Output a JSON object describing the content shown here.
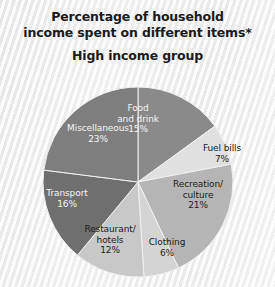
{
  "title": {
    "line1": "Percentage of household",
    "line2": "income spent on different items*",
    "subtitle": "High income group"
  },
  "chart_data": {
    "type": "pie",
    "title": "Percentage of household income spent on different items* High income group",
    "unit": "%",
    "start_angle_deg": 0,
    "direction": "clockwise",
    "total": 100,
    "legend": "none",
    "grid": false,
    "categories": [
      "Food and drink",
      "Fuel bills",
      "Recreation/culture",
      "Clothing",
      "Restaurant/hotels",
      "Transport",
      "Miscellaneous"
    ],
    "values": [
      15,
      7,
      21,
      6,
      12,
      16,
      23
    ],
    "colors": [
      "#8a8a8a",
      "#e0e0e0",
      "#b5b5b5",
      "#d4d4d4",
      "#c8c8c8",
      "#6f6f6f",
      "#7e7e7e"
    ],
    "slices": [
      {
        "name": "Food and drink",
        "label_line1": "Food",
        "label_line2": "and drink",
        "value": 15,
        "value_label": "15%",
        "color": "#8a8a8a",
        "text_color": "light"
      },
      {
        "name": "Fuel bills",
        "label_line1": "Fuel bills",
        "label_line2": "",
        "value": 7,
        "value_label": "7%",
        "color": "#e0e0e0",
        "text_color": "dark"
      },
      {
        "name": "Recreation/culture",
        "label_line1": "Recreation/",
        "label_line2": "culture",
        "value": 21,
        "value_label": "21%",
        "color": "#b5b5b5",
        "text_color": "dark"
      },
      {
        "name": "Clothing",
        "label_line1": "Clothing",
        "label_line2": "",
        "value": 6,
        "value_label": "6%",
        "color": "#d4d4d4",
        "text_color": "dark"
      },
      {
        "name": "Restaurant/hotels",
        "label_line1": "Restaurant/",
        "label_line2": "hotels",
        "value": 12,
        "value_label": "12%",
        "color": "#c8c8c8",
        "text_color": "dark"
      },
      {
        "name": "Transport",
        "label_line1": "Transport",
        "label_line2": "",
        "value": 16,
        "value_label": "16%",
        "color": "#6f6f6f",
        "text_color": "light"
      },
      {
        "name": "Miscellaneous",
        "label_line1": "Miscellaneous",
        "label_line2": "",
        "value": 23,
        "value_label": "23%",
        "color": "#7e7e7e",
        "text_color": "light"
      }
    ]
  }
}
